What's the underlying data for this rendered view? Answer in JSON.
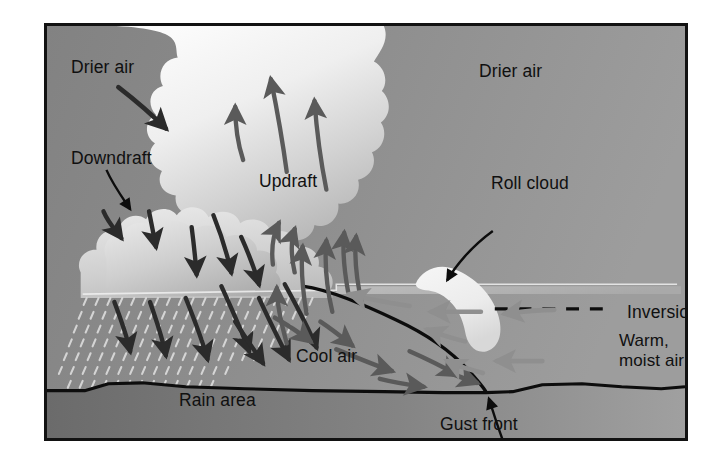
{
  "figure": {
    "frame_border_color": "#121212",
    "background_color": "#8d8d8d"
  },
  "colors": {
    "sky_dark": "#8a8a8a",
    "sky_light": "#9a9a9a",
    "cloud_white": "#f3f3f3",
    "cloud_shadow": "#b9b9b9",
    "ground_dark": "#6f6f6f",
    "ground_light": "#9b9b9b",
    "arrow_dark": "#2b2b2b",
    "arrow_mid": "#5a5a5a",
    "arrow_light": "#8f8f8f",
    "line_black": "#0d0d0d",
    "roll_cloud": "#efefef",
    "text": "#101010"
  },
  "labels": {
    "drier_air_left": "Drier air",
    "drier_air_right": "Drier air",
    "downdraft": "Downdraft",
    "updraft": "Updraft",
    "roll_cloud": "Roll cloud",
    "inversion": "Inversion",
    "warm_line1": "Warm,",
    "warm_line2": "moist air",
    "cool_air": "Cool air",
    "rain_area": "Rain area",
    "gust_front": "Gust front"
  },
  "features": [
    {
      "name": "cumulonimbus-cloud",
      "kind": "cloud",
      "description": "Large billowing storm cloud occupying the left half, reaching the top of the frame"
    },
    {
      "name": "roll-cloud",
      "kind": "cloud",
      "description": "Small curved banana-shaped bright cloud right of centre, above the gust front"
    },
    {
      "name": "rain-shaft",
      "kind": "texture",
      "description": "Dashed precipitation hatching beneath the cloud base on the left"
    },
    {
      "name": "gust-front-boundary",
      "kind": "line",
      "description": "Solid black curve descending from cloud base to the ground, marking the leading edge of the cool outflow"
    },
    {
      "name": "ground-line",
      "kind": "line",
      "description": "Solid black undulating surface line across the bottom"
    },
    {
      "name": "inversion-line",
      "kind": "dashed-line",
      "description": "Horizontal dashed black segment on the right marking the inversion level"
    }
  ],
  "arrow_groups": [
    {
      "name": "downdraft-arrows",
      "tone": "arrow_dark",
      "direction": "downward",
      "count": 9,
      "meaning": "Cool descending air inside and below the storm"
    },
    {
      "name": "updraft-arrows",
      "tone": "arrow_mid",
      "direction": "upward",
      "count": 9,
      "meaning": "Warm rising air feeding the storm"
    },
    {
      "name": "cool-air-outflow-arrows",
      "tone": "arrow_mid",
      "direction": "rightward",
      "count": 6,
      "meaning": "Cool outflow spreading away from the storm along the ground"
    },
    {
      "name": "warm-moist-inflow-arrows",
      "tone": "arrow_light",
      "direction": "leftward",
      "count": 6,
      "meaning": "Warm moist air flowing in toward the storm"
    },
    {
      "name": "drier-air-entrainment-arrow",
      "tone": "arrow_dark",
      "direction": "downward-right",
      "count": 1,
      "meaning": "Drier air entrained into the storm from aloft"
    }
  ],
  "leader_lines": [
    {
      "name": "downdraft-leader",
      "from": "Downdraft label",
      "to": "cloud downdraft region"
    },
    {
      "name": "roll-cloud-leader",
      "from": "Roll cloud label",
      "to": "roll cloud"
    },
    {
      "name": "gust-front-leader",
      "from": "Gust front label",
      "to": "gust front / ground intersection"
    }
  ]
}
